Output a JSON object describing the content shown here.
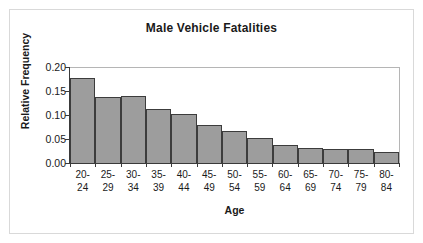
{
  "chart_data": {
    "type": "bar",
    "title": "Male Vehicle Fatalities",
    "xlabel": "Age",
    "ylabel": "Relative Frequency",
    "categories": [
      "20-24",
      "25-29",
      "30-34",
      "35-39",
      "40-44",
      "45-49",
      "50-54",
      "55-59",
      "60-64",
      "65-69",
      "70-74",
      "75-79",
      "80-84"
    ],
    "category_lines": [
      [
        "20-",
        "24"
      ],
      [
        "25-",
        "29"
      ],
      [
        "30-",
        "34"
      ],
      [
        "35-",
        "39"
      ],
      [
        "40-",
        "44"
      ],
      [
        "45-",
        "49"
      ],
      [
        "50-",
        "54"
      ],
      [
        "55-",
        "59"
      ],
      [
        "60-",
        "64"
      ],
      [
        "65-",
        "69"
      ],
      [
        "70-",
        "74"
      ],
      [
        "75-",
        "79"
      ],
      [
        "80-",
        "84"
      ]
    ],
    "values": [
      0.178,
      0.137,
      0.139,
      0.113,
      0.102,
      0.08,
      0.067,
      0.053,
      0.038,
      0.032,
      0.03,
      0.029,
      0.022
    ],
    "ylim": [
      0.0,
      0.2
    ],
    "yticks": [
      "0.00",
      "0.05",
      "0.10",
      "0.15",
      "0.20"
    ],
    "ytick_values": [
      0.0,
      0.05,
      0.1,
      0.15,
      0.2
    ],
    "grid": false,
    "legend": null,
    "bar_fill_color": "#9d9d9d",
    "bar_edge_color": "#3c3c3c",
    "frame_color": "#b5b5b5",
    "text_color": "#1a1a1a",
    "background_color": "#ffffff"
  }
}
